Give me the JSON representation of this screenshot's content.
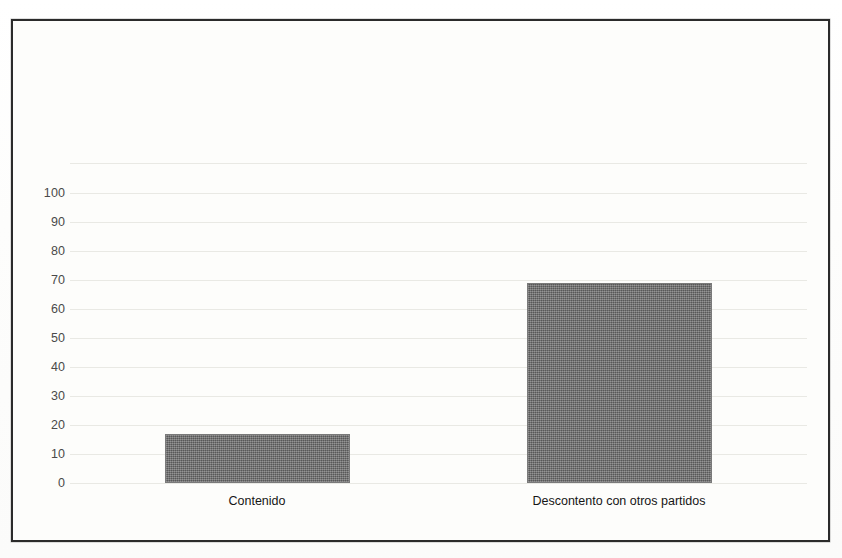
{
  "chart_data": {
    "type": "bar",
    "title": "",
    "subtitle": "",
    "xlabel": "",
    "ylabel": "",
    "categories": [
      "Contenido",
      "Descontento con otros partidos"
    ],
    "values": [
      17,
      69
    ],
    "series": [
      {
        "name": "",
        "values": [
          17,
          69
        ]
      }
    ],
    "ylim": [
      0,
      110
    ],
    "ytick_labels": [
      "100",
      "90",
      "80",
      "70",
      "60",
      "50",
      "40",
      "30",
      "20",
      "10",
      "0"
    ],
    "ytick_values": [
      100,
      90,
      80,
      70,
      60,
      50,
      40,
      30,
      20,
      10,
      0
    ],
    "gridlines": true,
    "gridline_values": [
      110,
      100,
      90,
      80,
      70,
      60,
      50,
      40,
      30,
      20,
      10,
      0
    ],
    "legend": null,
    "legend_position": "none",
    "annotations": [],
    "colors": {
      "bar_fill": "#6b6b6b",
      "bar_stroke": "#7a7a7a",
      "gridline": "#e9e9e4",
      "frame_border": "#2b2b2b",
      "tick_label": "#4a4a4a",
      "category_label": "#161616",
      "plot_background": "#fdfdfb",
      "page_background": "#fefefe"
    }
  }
}
